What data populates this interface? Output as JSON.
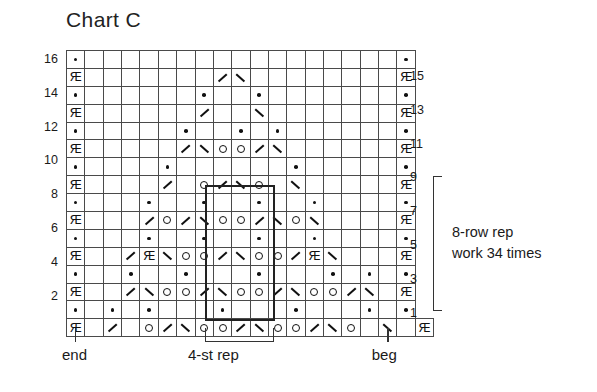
{
  "title": "Chart C",
  "legend": {
    "symbols": {
      "dot": "purl-dot",
      "ring": "yarn-over",
      "slash": "k2tog-left-slant",
      "backslash": "ssk-right-slant",
      "knot": "knot-stitch",
      "blank": "knit-blank",
      "gray": "no-stitch-gray"
    }
  },
  "row_numbers_left": [
    "16",
    "14",
    "12",
    "10",
    "8",
    "6",
    "4",
    "2"
  ],
  "row_numbers_right": [
    "15",
    "13",
    "11",
    "9",
    "7",
    "5",
    "3",
    "1"
  ],
  "row_repeat": {
    "line1": "8-row rep",
    "line2": "work 34 times",
    "bracket_top_row": "9",
    "bracket_bottom_row": "1"
  },
  "bottom_labels": {
    "end": "end",
    "st_rep": "4-st rep",
    "beg": "beg"
  },
  "chart_data": {
    "type": "heatmap",
    "title": "Chart C",
    "columns": 19,
    "rows": 16,
    "xlabel": "",
    "ylabel": "",
    "grid": true,
    "legend_position": "none",
    "st_repeat_columns": [
      9,
      12
    ],
    "row_repeat_rows": [
      1,
      8
    ],
    "cell_codes": {
      "b": "blank (knit)",
      "g": "gray (no stitch)",
      "d": "purl dot",
      "o": "yarn over",
      "/": "left-slant decrease",
      "\\": "right-slant decrease",
      "k": "knot stitch"
    },
    "rows_bottom_to_top": [
      {
        "row": 1,
        "cells": [
          "k",
          "g",
          "/",
          "b",
          "o",
          "/",
          "\\",
          "o",
          "o",
          "/",
          "\\",
          "o",
          "o",
          "/",
          "\\",
          "o",
          "b",
          "\\",
          "g",
          "k"
        ]
      },
      {
        "row": 2,
        "cells": [
          "d",
          "g",
          "d",
          "b",
          "d",
          "b",
          "b",
          "b",
          "d",
          "b",
          "b",
          "b",
          "d",
          "b",
          "b",
          "b",
          "d",
          "g",
          "d"
        ]
      },
      {
        "row": 3,
        "cells": [
          "k",
          "g",
          "g",
          "/",
          "\\",
          "o",
          "o",
          "/",
          "\\",
          "o",
          "o",
          "/",
          "\\",
          "o",
          "o",
          "/",
          "\\",
          "g",
          "k"
        ]
      },
      {
        "row": 4,
        "cells": [
          "d",
          "g",
          "b",
          "d",
          "b",
          "b",
          "d",
          "b",
          "b",
          "b",
          "d",
          "b",
          "b",
          "b",
          "d",
          "b",
          "d",
          "g",
          "d"
        ]
      },
      {
        "row": 5,
        "cells": [
          "k",
          "g",
          "g",
          "/",
          "k",
          "\\",
          "o",
          "o",
          "/",
          "\\",
          "o",
          "o",
          "/",
          "k",
          "\\",
          "b",
          "b",
          "g",
          "k"
        ]
      },
      {
        "row": 6,
        "cells": [
          "d",
          "g",
          "g",
          "b",
          "d",
          "b",
          "b",
          "d",
          "b",
          "b",
          "d",
          "b",
          "b",
          "d",
          "b",
          "g",
          "g",
          "g",
          "d"
        ]
      },
      {
        "row": 7,
        "cells": [
          "k",
          "g",
          "g",
          "g",
          "/",
          "o",
          "/",
          "\\",
          "o",
          "o",
          "/",
          "\\",
          "o",
          "\\",
          "g",
          "g",
          "g",
          "g",
          "k"
        ]
      },
      {
        "row": 8,
        "cells": [
          "d",
          "g",
          "g",
          "g",
          "d",
          "b",
          "b",
          "d",
          "b",
          "b",
          "d",
          "b",
          "b",
          "d",
          "g",
          "g",
          "g",
          "g",
          "d"
        ]
      },
      {
        "row": 9,
        "cells": [
          "k",
          "g",
          "g",
          "g",
          "g",
          "/",
          "b",
          "o",
          "/",
          "\\",
          "o",
          "b",
          "\\",
          "g",
          "g",
          "g",
          "g",
          "g",
          "k"
        ]
      },
      {
        "row": 10,
        "cells": [
          "d",
          "g",
          "g",
          "g",
          "g",
          "d",
          "b",
          "b",
          "b",
          "b",
          "b",
          "b",
          "d",
          "g",
          "g",
          "g",
          "g",
          "g",
          "d"
        ]
      },
      {
        "row": 11,
        "cells": [
          "k",
          "g",
          "g",
          "g",
          "g",
          "g",
          "/",
          "\\",
          "o",
          "o",
          "/",
          "\\",
          "g",
          "g",
          "g",
          "g",
          "g",
          "g",
          "k"
        ]
      },
      {
        "row": 12,
        "cells": [
          "d",
          "g",
          "g",
          "g",
          "g",
          "g",
          "d",
          "b",
          "b",
          "d",
          "b",
          "d",
          "g",
          "g",
          "g",
          "g",
          "g",
          "g",
          "d"
        ]
      },
      {
        "row": 13,
        "cells": [
          "k",
          "g",
          "g",
          "g",
          "g",
          "g",
          "g",
          "/",
          "b",
          "b",
          "\\",
          "g",
          "g",
          "g",
          "g",
          "g",
          "g",
          "g",
          "k"
        ]
      },
      {
        "row": 14,
        "cells": [
          "d",
          "g",
          "g",
          "g",
          "g",
          "g",
          "g",
          "d",
          "b",
          "b",
          "d",
          "g",
          "g",
          "g",
          "g",
          "g",
          "g",
          "g",
          "d"
        ]
      },
      {
        "row": 15,
        "cells": [
          "k",
          "g",
          "g",
          "g",
          "g",
          "g",
          "g",
          "g",
          "/",
          "\\",
          "g",
          "g",
          "g",
          "g",
          "g",
          "g",
          "g",
          "g",
          "k"
        ]
      },
      {
        "row": 16,
        "cells": [
          "d",
          "g",
          "g",
          "g",
          "g",
          "g",
          "g",
          "g",
          "b",
          "b",
          "g",
          "g",
          "g",
          "g",
          "g",
          "g",
          "g",
          "g",
          "d"
        ]
      }
    ]
  }
}
